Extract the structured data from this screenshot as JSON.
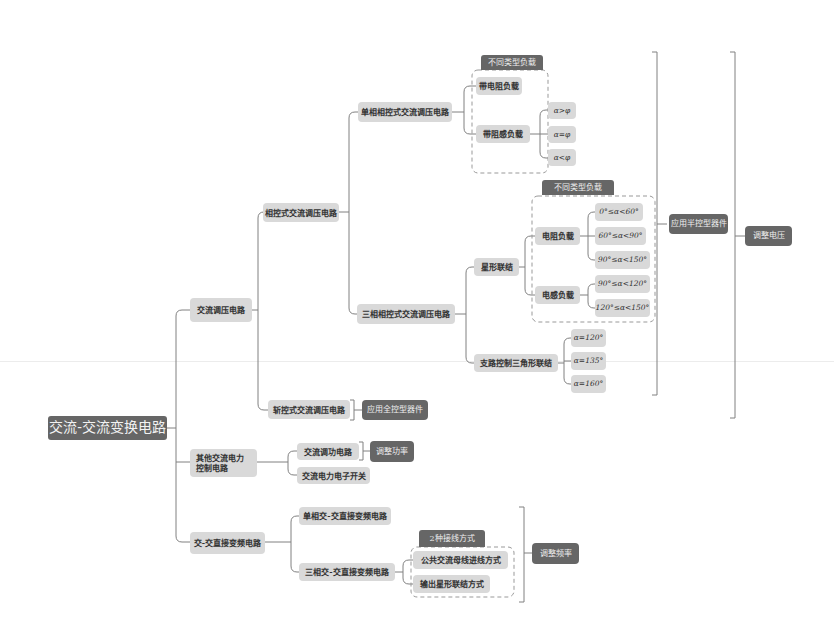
{
  "root": {
    "label": "交流-交流变换电路"
  },
  "branches": {
    "ac_voltage": {
      "label": "交流调压电路",
      "phase_control": {
        "label": "相控式交流调压电路",
        "single_phase": {
          "label": "单相相控式交流调压电路",
          "group_tag": "不同类型负载",
          "resistive": "带电阻负载",
          "inductive": {
            "label": "带阻感负载",
            "cases": [
              "α>φ",
              "α=φ",
              "α<φ"
            ]
          }
        },
        "three_phase": {
          "label": "三相相控式交流调压电路",
          "star": {
            "label": "星形联结",
            "group_tag": "不同类型负载",
            "resistive": {
              "label": "电阻负载",
              "ranges": [
                "0°≤α<60°",
                "60°≤α<90°",
                "90°≤α<150°"
              ]
            },
            "inductive": {
              "label": "电感负载",
              "ranges": [
                "90°≤α<120°",
                "120°≤α<150°"
              ]
            }
          },
          "delta": {
            "label": "支路控制三角形联结",
            "angles": [
              "α=120°",
              "α=135°",
              "α=160°"
            ]
          }
        },
        "device_tag": "应用半控型器件"
      },
      "chopper": {
        "label": "斩控式交流调压电路",
        "device_tag": "应用全控型器件"
      },
      "purpose_tag": "调整电压"
    },
    "other": {
      "label": "其他交流电力控制电路",
      "power_control": "交流调功电路",
      "power_switch": "交流电力电子开关",
      "purpose_tag": "调整功率"
    },
    "cycloconverter": {
      "label": "交-交直接变频电路",
      "single_phase": "单相交-交直接变频电路",
      "three_phase": {
        "label": "三相交-交直接变频电路",
        "group_tag": "2种接线方式",
        "methods": [
          "公共交流母线进线方式",
          "输出星形联结方式"
        ]
      },
      "purpose_tag": "调整频率"
    }
  },
  "colors": {
    "node_light": "#d9d9d9",
    "node_dark": "#666666",
    "line": "#808080"
  }
}
